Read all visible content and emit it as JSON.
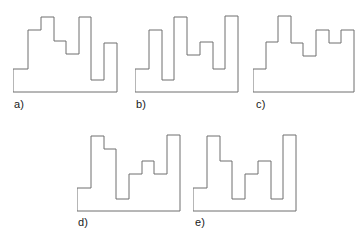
{
  "figure": {
    "background_color": "#ffffff",
    "stroke_color": "#6e6e6e",
    "fill_color": "#ffffff",
    "label_color": "#1a1a1a",
    "width": 363,
    "height": 246,
    "option_count": 5
  },
  "options": [
    {
      "id": "a",
      "label": "a)",
      "label_x": 14,
      "label_y": 99,
      "box_x": 13,
      "box_y": 12,
      "box_w": 105,
      "box_h": 81,
      "viewbox": "0 0 105 81",
      "points": "0 57, 0 80, 104 80, 104 31, 91 31, 91 68, 78 68, 78 5, 66 5, 66 5, 66 42, 53 42, 53 29, 41 29, 41 5, 28 5, 28 18, 15 18, 15 57, 0 57"
    },
    {
      "id": "b",
      "label": "b)",
      "label_x": 136,
      "label_y": 99,
      "box_x": 135,
      "box_y": 12,
      "box_w": 104,
      "box_h": 81,
      "viewbox": "0 0 104 81",
      "points": "0 57, 0 80, 103 80, 103 4, 90 4, 90 57, 78 57, 78 30, 65 30, 65 43, 52 43, 52 5, 39 5, 39 5, 39 68, 27 68, 27 18, 14 18, 14 57, 0 57"
    },
    {
      "id": "c",
      "label": "c)",
      "label_x": 256,
      "label_y": 99,
      "box_x": 253,
      "box_y": 12,
      "box_w": 102,
      "box_h": 81,
      "viewbox": "0 0 102 81",
      "points": "0 57, 0 80, 101 80, 101 18, 88 18, 88 31, 76 31, 76 18, 63 18, 63 44, 50 44, 50 31, 38 31, 38 4, 25 4, 25 30, 13 30, 13 57, 0 57"
    },
    {
      "id": "d",
      "label": "d)",
      "label_x": 78,
      "label_y": 217,
      "box_x": 77,
      "box_y": 131,
      "box_w": 104,
      "box_h": 81,
      "viewbox": "0 0 104 81",
      "points": "0 57, 0 80, 103 80, 103 4, 90 4, 90 43, 77 43, 77 30, 65 30, 65 43, 52 43, 52 68, 39 68, 39 18, 27 18, 27 5, 14 5, 14 57, 0 57"
    },
    {
      "id": "e",
      "label": "e)",
      "label_x": 195,
      "label_y": 217,
      "box_x": 193,
      "box_y": 131,
      "box_w": 104,
      "box_h": 81,
      "viewbox": "0 0 104 81",
      "points": "0 57, 0 80, 103 80, 103 4, 90 4, 90 68, 78 68, 78 30, 65 30, 65 43, 52 43, 52 68, 39 68, 39 30, 27 30, 27 5, 14 5, 14 57, 0 57"
    }
  ]
}
